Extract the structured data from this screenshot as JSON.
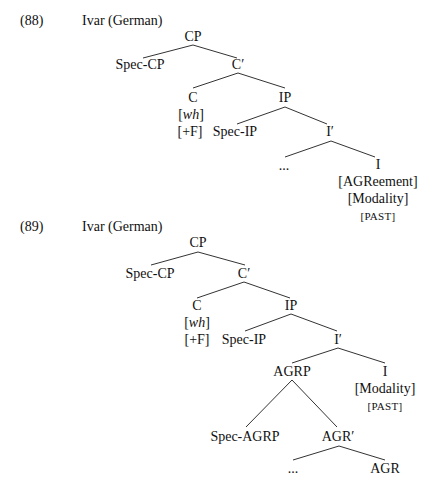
{
  "examples": [
    {
      "number": "(88)",
      "title": "Ivar (German)",
      "number_pos": [
        20,
        21
      ],
      "title_pos": [
        82,
        21
      ],
      "nodes": [
        {
          "id": "CP",
          "label": "CP",
          "x": 193,
          "y": 37
        },
        {
          "id": "Spec-CP",
          "label": "Spec-CP",
          "x": 140,
          "y": 65
        },
        {
          "id": "C-bar",
          "label": "C′",
          "x": 238,
          "y": 65
        },
        {
          "id": "C",
          "label": "C",
          "x": 193,
          "y": 98
        },
        {
          "id": "C-wh",
          "label_pre": "[",
          "label_it": "wh",
          "label_post": "]",
          "x": 191,
          "y": 115
        },
        {
          "id": "C-F",
          "label": "[+F]",
          "x": 190,
          "y": 132
        },
        {
          "id": "IP",
          "label": "IP",
          "x": 285,
          "y": 98
        },
        {
          "id": "Spec-IP",
          "label": "Spec-IP",
          "x": 235,
          "y": 132
        },
        {
          "id": "I-bar",
          "label": "I′",
          "x": 330,
          "y": 132
        },
        {
          "id": "ellipsis",
          "label": "...",
          "x": 284,
          "y": 166
        },
        {
          "id": "I",
          "label": "I",
          "x": 378,
          "y": 165
        },
        {
          "id": "I-agr",
          "label": "[AGReement]",
          "x": 378,
          "y": 182
        },
        {
          "id": "I-mod",
          "label": "[Modality]",
          "x": 378,
          "y": 199
        },
        {
          "id": "I-past",
          "label": "[PAST]",
          "x": 378,
          "y": 216,
          "smallcaps": true
        }
      ],
      "edges": [
        [
          193,
          45,
          143,
          58
        ],
        [
          193,
          45,
          237,
          58
        ],
        [
          238,
          73,
          193,
          88
        ],
        [
          238,
          73,
          285,
          88
        ],
        [
          285,
          107,
          237,
          124
        ],
        [
          285,
          107,
          327,
          124
        ],
        [
          331,
          141,
          285,
          157
        ],
        [
          331,
          141,
          375,
          157
        ]
      ]
    },
    {
      "number": "(89)",
      "title": "Ivar (German)",
      "number_pos": [
        20,
        227
      ],
      "title_pos": [
        82,
        227
      ],
      "nodes": [
        {
          "id": "CP",
          "label": "CP",
          "x": 198,
          "y": 243
        },
        {
          "id": "Spec-CP",
          "label": "Spec-CP",
          "x": 150,
          "y": 274
        },
        {
          "id": "C-bar",
          "label": "C′",
          "x": 244,
          "y": 274
        },
        {
          "id": "C",
          "label": "C",
          "x": 197,
          "y": 306
        },
        {
          "id": "C-wh",
          "label_pre": "[",
          "label_it": "wh",
          "label_post": "]",
          "x": 197,
          "y": 323
        },
        {
          "id": "C-F",
          "label": "[+F]",
          "x": 197,
          "y": 340
        },
        {
          "id": "IP",
          "label": "IP",
          "x": 291,
          "y": 306
        },
        {
          "id": "Spec-IP",
          "label": "Spec-IP",
          "x": 244,
          "y": 340
        },
        {
          "id": "I-bar",
          "label": "I′",
          "x": 338,
          "y": 340
        },
        {
          "id": "AGRP",
          "label": "AGRP",
          "x": 292,
          "y": 372
        },
        {
          "id": "I",
          "label": "I",
          "x": 385,
          "y": 372
        },
        {
          "id": "I-mod",
          "label": "[Modality]",
          "x": 385,
          "y": 389
        },
        {
          "id": "I-past",
          "label": "[PAST]",
          "x": 385,
          "y": 406,
          "smallcaps": true
        },
        {
          "id": "Spec-AGRP",
          "label": "Spec-AGRP",
          "x": 245,
          "y": 437
        },
        {
          "id": "AGR-bar",
          "label": "AGR′",
          "x": 338,
          "y": 437
        },
        {
          "id": "ellipsis",
          "label": "...",
          "x": 293,
          "y": 469
        },
        {
          "id": "AGR",
          "label": "AGR",
          "x": 385,
          "y": 469
        }
      ],
      "edges": [
        [
          198,
          252,
          151,
          265
        ],
        [
          198,
          252,
          245,
          265
        ],
        [
          244,
          282,
          197,
          298
        ],
        [
          244,
          282,
          290,
          298
        ],
        [
          291,
          314,
          245,
          331
        ],
        [
          291,
          314,
          337,
          331
        ],
        [
          338,
          348,
          292,
          363
        ],
        [
          338,
          348,
          385,
          363
        ],
        [
          292,
          380,
          246,
          427
        ],
        [
          292,
          380,
          337,
          427
        ],
        [
          339,
          446,
          293,
          460
        ],
        [
          339,
          446,
          385,
          460
        ]
      ]
    }
  ]
}
